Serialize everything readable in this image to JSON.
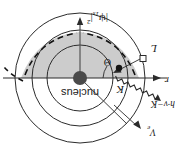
{
  "figure": {
    "title": "Atomic electron scattering diagram (rotated 180 degrees)",
    "orientation_degrees": 180,
    "background_color": "#ffffff",
    "stroke_color": "#1a1a1a",
    "shade_color": "#c9c9c9",
    "nucleus_color": "#4a4a4a"
  },
  "labels": {
    "nucleus": "nucleus",
    "radius": "r",
    "angular_momentum": "L",
    "kinetic_energy": "K",
    "angle": "Θ",
    "photon_energy": "h·ν−K",
    "electron_velocity": "V",
    "electron_velocity_sub": "e",
    "wavefunction_prefix": "|ψ",
    "wavefunction_sub": "1s",
    "wavefunction_suffix": "|",
    "wavefunction_power": "2"
  },
  "icons": {
    "nucleus_dot": "filled-circle-icon",
    "electron_dot": "filled-circle-icon",
    "open_square": "open-square-icon",
    "photon_wave": "squiggly-wave-icon",
    "arrow": "arrowhead-icon"
  },
  "geometry": {
    "center": {
      "x": 103,
      "y": 73
    },
    "outer_circle_radius": 65,
    "mid_circle_radius": 48,
    "inner_circle_radius": 33,
    "nucleus_dot_radius": 7,
    "electron_dot_radius": 3
  }
}
